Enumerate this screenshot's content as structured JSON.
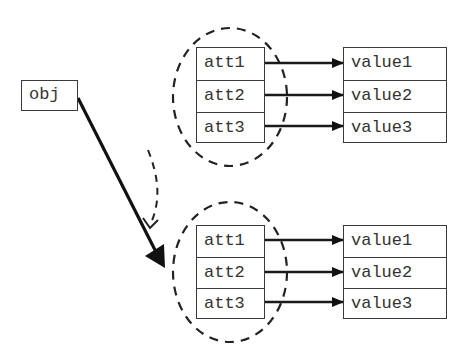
{
  "diagram": {
    "object": {
      "label": "obj"
    },
    "top_group": {
      "attributes": [
        "att1",
        "att2",
        "att3"
      ],
      "values": [
        "value1",
        "value2",
        "value3"
      ]
    },
    "bottom_group": {
      "attributes": [
        "att1",
        "att2",
        "att3"
      ],
      "values": [
        "value1",
        "value2",
        "value3"
      ]
    },
    "edges": [
      {
        "from": "obj",
        "to": "bottom_group",
        "style": "solid-thick"
      },
      {
        "from": "top_group",
        "to": "bottom_group",
        "style": "dashed"
      },
      {
        "from": "att1",
        "to": "value1",
        "style": "solid"
      },
      {
        "from": "att2",
        "to": "value2",
        "style": "solid"
      },
      {
        "from": "att3",
        "to": "value3",
        "style": "solid"
      }
    ],
    "colors": {
      "stroke": "#1a1a1a",
      "text": "#333333",
      "background": "#ffffff"
    }
  }
}
